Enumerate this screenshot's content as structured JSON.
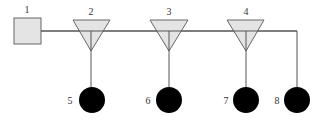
{
  "diagram": {
    "type": "network-topology",
    "colors": {
      "line": "#555555",
      "shape_fill": "#e4e4e4",
      "shape_stroke": "#666666",
      "terminal_fill": "#000000",
      "label": "#333333"
    },
    "source": {
      "id": "1",
      "label": "1",
      "shape": "square",
      "x": 14,
      "y": 18,
      "size": 27,
      "label_x": 27,
      "label_y": 13
    },
    "splitters": [
      {
        "id": "2",
        "label": "2",
        "shape": "inverted-triangle",
        "left": 73,
        "right": 110,
        "top": 20,
        "apex_x": 91,
        "apex_y": 51,
        "label_x": 91,
        "label_y": 15
      },
      {
        "id": "3",
        "label": "3",
        "shape": "inverted-triangle",
        "left": 150,
        "right": 188,
        "top": 20,
        "apex_x": 169,
        "apex_y": 51,
        "label_x": 169,
        "label_y": 15
      },
      {
        "id": "4",
        "label": "4",
        "shape": "inverted-triangle",
        "left": 227,
        "right": 264,
        "top": 20,
        "apex_x": 246,
        "apex_y": 51,
        "label_x": 246,
        "label_y": 15
      }
    ],
    "terminals": [
      {
        "id": "5",
        "label": "5",
        "shape": "filled-circle",
        "cx": 92,
        "cy": 100,
        "r": 13,
        "label_x": 70,
        "label_y": 104
      },
      {
        "id": "6",
        "label": "6",
        "shape": "filled-circle",
        "cx": 169,
        "cy": 100,
        "r": 13,
        "label_x": 148,
        "label_y": 104
      },
      {
        "id": "7",
        "label": "7",
        "shape": "filled-circle",
        "cx": 246,
        "cy": 100,
        "r": 13,
        "label_x": 226,
        "label_y": 104
      },
      {
        "id": "8",
        "label": "8",
        "shape": "filled-circle",
        "cx": 297,
        "cy": 100,
        "r": 13,
        "label_x": 277,
        "label_y": 104
      }
    ],
    "bus": {
      "y": 31,
      "x_start": 41,
      "x_end": 297
    },
    "connections": [
      {
        "from": "1",
        "to": "2"
      },
      {
        "from": "2",
        "to": "3"
      },
      {
        "from": "3",
        "to": "4"
      },
      {
        "from": "4",
        "to": "8"
      },
      {
        "from": "2",
        "to": "5"
      },
      {
        "from": "3",
        "to": "6"
      },
      {
        "from": "4",
        "to": "7"
      }
    ]
  }
}
